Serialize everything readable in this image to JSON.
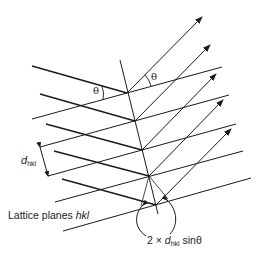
{
  "diagram": {
    "labels": {
      "theta_incident": "θ",
      "theta_reflected": "θ",
      "d_symbol": "d",
      "d_subscript": "hkl",
      "lattice_prefix": "Lattice planes ",
      "lattice_hkl": "hkl",
      "path_prefix": "2 × ",
      "path_d": "d",
      "path_subscript": "hkl",
      "path_suffix": " sinθ"
    },
    "colors": {
      "line": "#1a1a1a",
      "text": "#222222",
      "background": "#ffffff"
    },
    "counts": {
      "incident_rays": 5,
      "reflected_rays": 5,
      "lattice_planes": 7
    }
  }
}
